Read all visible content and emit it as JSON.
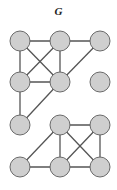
{
  "title": "G",
  "colors": {
    "node_fill": "#cfcfcf",
    "node_stroke": "#6a6a6a",
    "edge": "#555555"
  },
  "node_radius": 10,
  "nodes": [
    {
      "id": "a",
      "x": 20,
      "y": 41
    },
    {
      "id": "b",
      "x": 60,
      "y": 41
    },
    {
      "id": "c",
      "x": 100,
      "y": 41
    },
    {
      "id": "d",
      "x": 20,
      "y": 82
    },
    {
      "id": "e",
      "x": 60,
      "y": 82
    },
    {
      "id": "f",
      "x": 100,
      "y": 82
    },
    {
      "id": "g",
      "x": 20,
      "y": 125
    },
    {
      "id": "h",
      "x": 60,
      "y": 125
    },
    {
      "id": "i",
      "x": 100,
      "y": 125
    },
    {
      "id": "j",
      "x": 20,
      "y": 167
    },
    {
      "id": "k",
      "x": 60,
      "y": 167
    },
    {
      "id": "l",
      "x": 100,
      "y": 167
    }
  ],
  "edges": [
    [
      "a",
      "b"
    ],
    [
      "b",
      "c"
    ],
    [
      "a",
      "d"
    ],
    [
      "a",
      "e"
    ],
    [
      "b",
      "d"
    ],
    [
      "b",
      "e"
    ],
    [
      "c",
      "e"
    ],
    [
      "d",
      "e"
    ],
    [
      "d",
      "g"
    ],
    [
      "e",
      "g"
    ],
    [
      "h",
      "i"
    ],
    [
      "h",
      "j"
    ],
    [
      "h",
      "k"
    ],
    [
      "h",
      "l"
    ],
    [
      "i",
      "k"
    ],
    [
      "i",
      "l"
    ],
    [
      "j",
      "k"
    ],
    [
      "k",
      "l"
    ]
  ]
}
